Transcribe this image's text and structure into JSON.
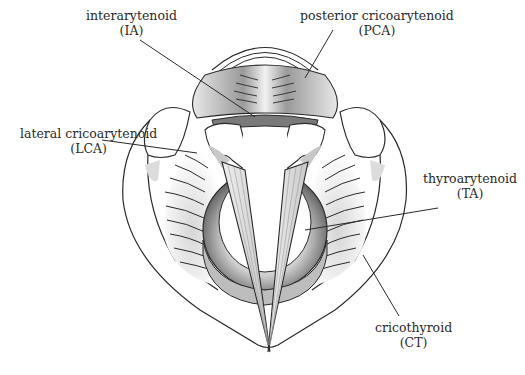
{
  "figure": {
    "colors": {
      "line": "#2a2a2a",
      "shade_dark": "#6e6e6e",
      "shade_light": "#d9d9d9",
      "background": "#ffffff"
    }
  },
  "labels": [
    {
      "id": "IA",
      "name": "interarytenoid",
      "abbr": "(IA)"
    },
    {
      "id": "PCA",
      "name": "posterior cricoarytenoid",
      "abbr": "(PCA)"
    },
    {
      "id": "LCA",
      "name": "lateral cricoarytenoid",
      "abbr": "(LCA)"
    },
    {
      "id": "TA",
      "name": "thyroarytenoid",
      "abbr": "(TA)"
    },
    {
      "id": "CT",
      "name": "cricothyroid",
      "abbr": "(CT)"
    }
  ]
}
